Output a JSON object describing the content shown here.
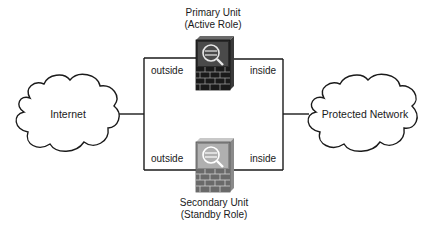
{
  "diagram": {
    "primary_unit": {
      "line1": "Primary Unit",
      "line2": "(Active Role)"
    },
    "secondary_unit": {
      "line1": "Secondary Unit",
      "line2": "(Standby Role)"
    },
    "interfaces": {
      "primary_outside": "outside",
      "primary_inside": "inside",
      "secondary_outside": "outside",
      "secondary_inside": "inside"
    },
    "clouds": {
      "left": "Internet",
      "right": "Protected Network"
    },
    "colors": {
      "line": "#1a1a1a",
      "primary_firewall_body": "#2b2b2b",
      "primary_firewall_top": "#4a4a4a",
      "secondary_firewall_body": "#8a8a8a",
      "secondary_firewall_top": "#b0b0b0"
    }
  }
}
